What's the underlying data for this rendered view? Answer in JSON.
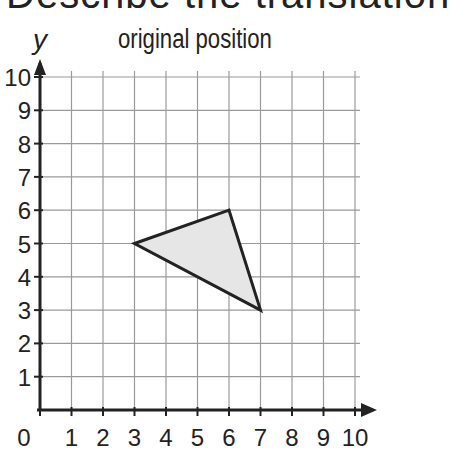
{
  "header": {
    "cut_title": "Describe the translation",
    "title": "original position"
  },
  "chart_data": {
    "type": "scatter",
    "title": "original position",
    "xlabel": "x",
    "ylabel": "y",
    "xlim": [
      0,
      10
    ],
    "ylim": [
      0,
      10
    ],
    "grid": true,
    "x_ticks": [
      "0",
      "1",
      "2",
      "3",
      "4",
      "5",
      "6",
      "7",
      "8",
      "9",
      "10"
    ],
    "y_ticks": [
      "1",
      "2",
      "3",
      "4",
      "5",
      "6",
      "7",
      "8",
      "9",
      "10"
    ],
    "shapes": [
      {
        "name": "triangle",
        "vertices": [
          [
            3,
            5
          ],
          [
            6,
            6
          ],
          [
            7,
            3
          ]
        ],
        "fill": "#e6e6e6",
        "stroke": "#222222"
      }
    ]
  }
}
